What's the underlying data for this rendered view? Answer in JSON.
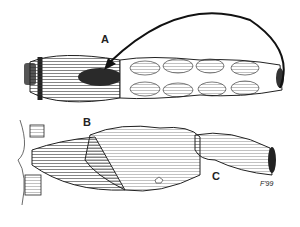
{
  "figure": {
    "labels": {
      "a": "A",
      "b": "B",
      "c": "C"
    },
    "signature": "F'99",
    "colors": {
      "ink": "#1a1a1a",
      "background": "#ffffff"
    }
  }
}
